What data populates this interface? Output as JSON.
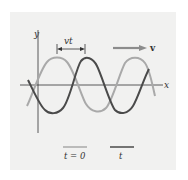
{
  "figure": {
    "axes": {
      "x_label": "x",
      "y_label": "y"
    },
    "displacement_label": "vt",
    "velocity_label": "v",
    "legend": [
      {
        "label": "t = 0",
        "color": "#a9a9a9"
      },
      {
        "label": "t",
        "color": "#4a4a4a"
      }
    ]
  },
  "colors": {
    "panel": "#f1f1f0",
    "wave_t0": "#a9a9a9",
    "wave_t": "#4a4a4a",
    "arrow": "#8c8c8c",
    "axis": "#333333"
  }
}
